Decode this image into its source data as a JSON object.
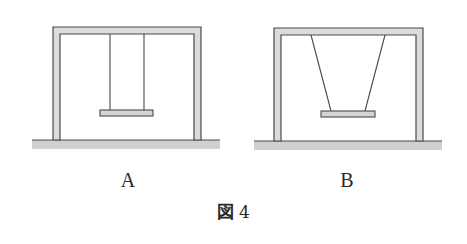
{
  "figure": {
    "caption_prefix": "図",
    "caption_number": "4",
    "panels": [
      {
        "id": "A",
        "label": "A",
        "description": "swing with vertical parallel ropes",
        "frame": {
          "left": 53,
          "right": 201,
          "top": 27,
          "post_width": 7,
          "ground_y": 140
        },
        "ground": {
          "x1": 32,
          "x2": 220,
          "y": 140,
          "thickness": 9
        },
        "ropes": [
          {
            "x1": 110,
            "y1": 34,
            "x2": 110,
            "y2": 110
          },
          {
            "x1": 144,
            "y1": 34,
            "x2": 144,
            "y2": 110
          }
        ],
        "seat": {
          "x": 100,
          "y": 110,
          "width": 53,
          "height": 6
        }
      },
      {
        "id": "B",
        "label": "B",
        "description": "swing with ropes angled inward toward seat",
        "frame": {
          "left": 274,
          "right": 423,
          "top": 28,
          "post_width": 7,
          "ground_y": 141
        },
        "ground": {
          "x1": 254,
          "x2": 442,
          "y": 141,
          "thickness": 9
        },
        "ropes": [
          {
            "x1": 311,
            "y1": 35,
            "x2": 331,
            "y2": 111
          },
          {
            "x1": 385,
            "y1": 35,
            "x2": 365,
            "y2": 111
          }
        ],
        "seat": {
          "x": 321,
          "y": 111,
          "width": 54,
          "height": 6
        }
      }
    ]
  },
  "colors": {
    "stroke": "#4a4a4a",
    "frame_fill": "#d9dcd8",
    "ground_fill": "#cfd1cd",
    "seat_fill": "#d4d6d2",
    "background": "#ffffff",
    "text": "#2a2a2a"
  }
}
